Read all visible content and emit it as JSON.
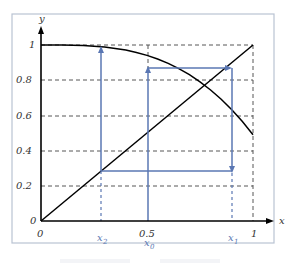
{
  "diagram": {
    "type": "cobweb plot",
    "axes": {
      "x_label": "x",
      "y_label": "y",
      "x_ticks": [
        "0",
        "0.5",
        "1"
      ],
      "y_ticks": [
        "0",
        "0.2",
        "0.4",
        "0.6",
        "0.8",
        "1"
      ]
    },
    "points": {
      "x0_label": "x",
      "x0_sub": "0",
      "x1_label": "x",
      "x1_sub": "1",
      "x2_label": "x",
      "x2_sub": "2"
    },
    "values": {
      "x0": 0.5,
      "x1": 0.896,
      "x2": 0.283,
      "f_x0": 0.865,
      "f_x1": 0.283
    },
    "colors": {
      "cobweb": "#5a77b3",
      "curve": "#000000",
      "frame": "#b9c3d3"
    }
  }
}
